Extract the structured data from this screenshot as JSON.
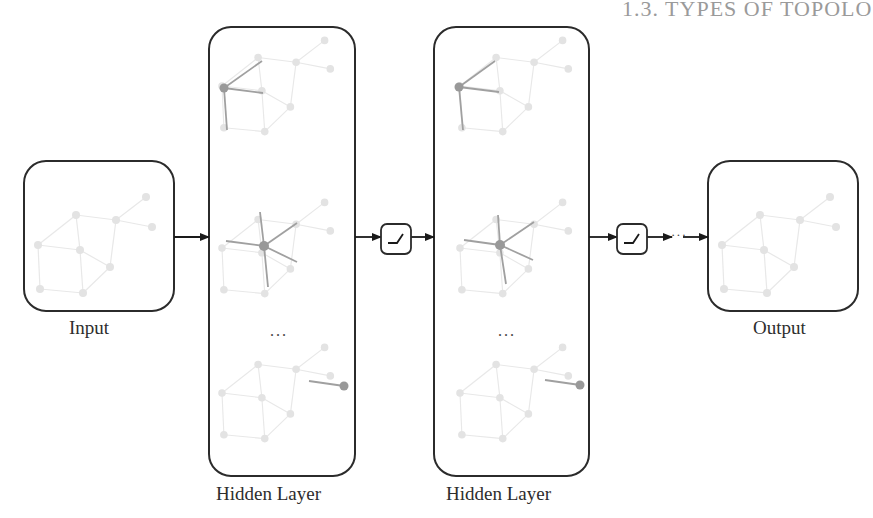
{
  "header": {
    "text": "1.3. TYPES OF TOPOLO"
  },
  "colors": {
    "stroke": "#2b2b2b",
    "graph_faint": "#e6e6e6",
    "graph_node_faint": "#e0e0e0",
    "highlight": "#9e9e9e",
    "highlight_node": "#999999",
    "header": "#9a9a9a"
  },
  "labels": {
    "input": "Input",
    "hidden_1": "Hidden Layer",
    "hidden_2": "Hidden Layer",
    "output": "Output",
    "ellipsis_1": "...",
    "ellipsis_2": "...",
    "continuation": "···"
  },
  "boxes": [
    {
      "id": "input",
      "x": 24,
      "y": 161,
      "w": 150,
      "h": 150,
      "r": 22
    },
    {
      "id": "hidden_1",
      "x": 209,
      "y": 27,
      "w": 146,
      "h": 449,
      "r": 22
    },
    {
      "id": "hidden_2",
      "x": 434,
      "y": 27,
      "w": 155,
      "h": 449,
      "r": 22
    },
    {
      "id": "output",
      "x": 708,
      "y": 161,
      "w": 150,
      "h": 150,
      "r": 22
    }
  ],
  "activations": [
    {
      "id": "relu_1",
      "x": 381,
      "y": 224,
      "w": 30,
      "h": 30,
      "icon": "relu-icon"
    },
    {
      "id": "relu_2",
      "x": 617,
      "y": 224,
      "w": 30,
      "h": 30,
      "icon": "relu-icon"
    }
  ],
  "arrows": [
    {
      "x1": 174,
      "y1": 237,
      "x2": 209,
      "y2": 237
    },
    {
      "x1": 355,
      "y1": 237,
      "x2": 381,
      "y2": 237
    },
    {
      "x1": 411,
      "y1": 237,
      "x2": 434,
      "y2": 237
    },
    {
      "x1": 589,
      "y1": 237,
      "x2": 617,
      "y2": 237
    },
    {
      "x1": 647,
      "y1": 237,
      "x2": 672,
      "y2": 237
    },
    {
      "x1": 683,
      "y1": 237,
      "x2": 708,
      "y2": 237
    }
  ]
}
